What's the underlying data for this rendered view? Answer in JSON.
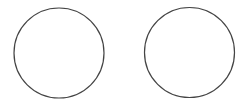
{
  "canvas": {
    "width": 251,
    "height": 107,
    "background": "#ffffff"
  },
  "shapes": [
    {
      "type": "circle",
      "name": "left-circle",
      "cx": 59,
      "cy": 53,
      "r": 45,
      "stroke": "#444444",
      "stroke_width": 1.2,
      "fill": "#ffffff"
    },
    {
      "type": "circle",
      "name": "right-circle",
      "cx": 189.5,
      "cy": 52.5,
      "r": 45,
      "stroke": "#444444",
      "stroke_width": 1.2,
      "fill": "#ffffff"
    }
  ]
}
